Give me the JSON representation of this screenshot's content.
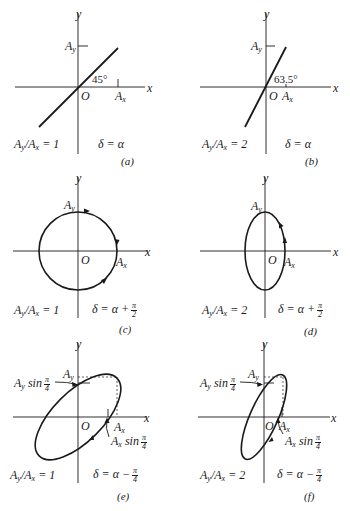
{
  "figure": {
    "panels": [
      {
        "id": "a",
        "caption": "(a)",
        "ratio": "A_y/A_x = 1",
        "ratio_value": "1",
        "delta": "δ = α",
        "angle_label": "45°",
        "shape": "line",
        "slope_deg": 45
      },
      {
        "id": "b",
        "caption": "(b)",
        "ratio": "A_y/A_x = 2",
        "ratio_value": "2",
        "delta": "δ = α",
        "angle_label": "63.5°",
        "shape": "line",
        "slope_deg": 63.5
      },
      {
        "id": "c",
        "caption": "(c)",
        "ratio": "A_y/A_x = 1",
        "ratio_value": "1",
        "delta": "δ = α + π/2",
        "delta_prefix": "δ = α +",
        "delta_frac_num": "π",
        "delta_frac_den": "2",
        "shape": "circle"
      },
      {
        "id": "d",
        "caption": "(d)",
        "ratio": "A_y/A_x = 2",
        "ratio_value": "2",
        "delta": "δ = α + π/2",
        "delta_prefix": "δ = α +",
        "delta_frac_num": "π",
        "delta_frac_den": "2",
        "shape": "ellipse"
      },
      {
        "id": "e",
        "caption": "(e)",
        "ratio": "A_y/A_x = 1",
        "ratio_value": "1",
        "delta": "δ = α − π/4",
        "delta_prefix": "δ = α −",
        "delta_frac_num": "π",
        "delta_frac_den": "4",
        "shape": "tilted-ellipse",
        "annot_y": "A_y sin π/4",
        "annot_x": "A_x sin π/4"
      },
      {
        "id": "f",
        "caption": "(f)",
        "ratio": "A_y/A_x = 2",
        "ratio_value": "2",
        "delta": "δ = α − π/4",
        "delta_prefix": "δ = α −",
        "delta_frac_num": "π",
        "delta_frac_den": "4",
        "shape": "tilted-ellipse",
        "annot_y": "A_y sin π/4",
        "annot_x": "A_x sin π/4"
      }
    ],
    "axis_labels": {
      "x": "x",
      "y": "y",
      "origin": "O",
      "Ax": "A",
      "Ax_sub": "x",
      "Ay": "A",
      "Ay_sub": "y",
      "sin": "sin",
      "pi": "π",
      "four": "4"
    },
    "colors": {
      "ink": "#1a1a1a",
      "background": "#ffffff"
    }
  }
}
